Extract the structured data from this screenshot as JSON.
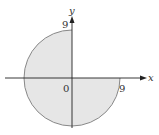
{
  "diagram": {
    "radius": 9,
    "colors": {
      "fill": "#e6e6e6",
      "outline": "#888888",
      "axis": "#222222"
    },
    "labels": {
      "x_axis": "x",
      "y_axis": "y",
      "origin": "0",
      "y_intercept": "9",
      "x_intercept": "9"
    }
  }
}
